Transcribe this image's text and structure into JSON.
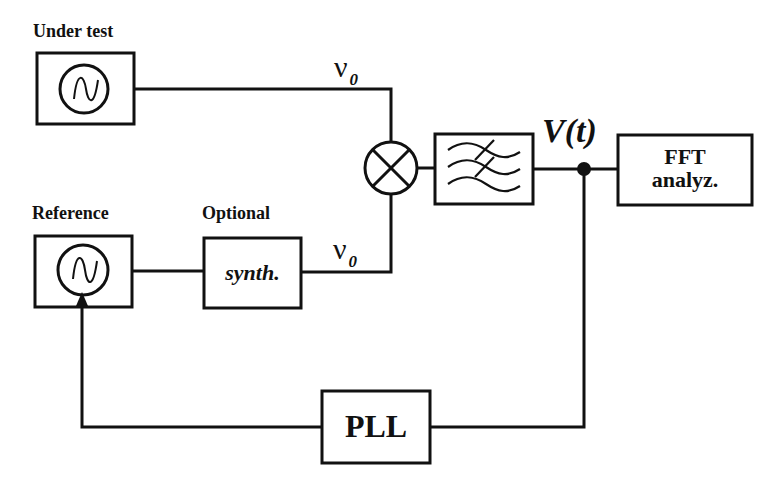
{
  "diagram": {
    "type": "block-diagram",
    "labels": {
      "under_test": "Under test",
      "reference": "Reference",
      "optional": "Optional"
    },
    "blocks": {
      "oscillator_under_test": {
        "icon": "sine-source-icon"
      },
      "oscillator_reference": {
        "icon": "sine-source-icon"
      },
      "synthesizer": {
        "text": "synth."
      },
      "mixer": {
        "icon": "mixer-cross-icon"
      },
      "filter": {
        "icon": "lowpass-filter-icon"
      },
      "fft": {
        "line1": "FFT",
        "line2": "analyz."
      },
      "pll": {
        "text": "PLL"
      }
    },
    "signals": {
      "nu_top": {
        "symbol": "ν",
        "subscript": "0"
      },
      "nu_bottom": {
        "symbol": "ν",
        "subscript": "0"
      },
      "vt": "V(t)"
    },
    "colors": {
      "stroke": "#111111",
      "background": "#ffffff"
    }
  }
}
